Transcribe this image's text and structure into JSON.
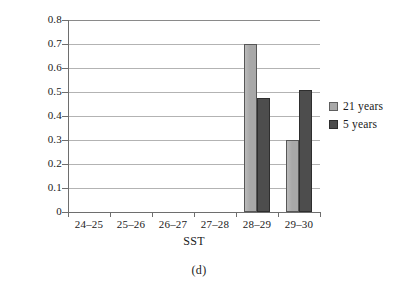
{
  "chart_data": {
    "type": "bar",
    "title": "",
    "subtitle": "",
    "xlabel": "SST",
    "ylabel": "",
    "categories": [
      "24–25",
      "25–26",
      "26–27",
      "27–28",
      "28–29",
      "29–30"
    ],
    "series": [
      {
        "name": "21 years",
        "values": [
          0,
          0,
          0,
          0,
          0.7,
          0.3
        ],
        "color": "#a8a8a8"
      },
      {
        "name": "5 years",
        "values": [
          0,
          0,
          0,
          0,
          0.475,
          0.51
        ],
        "color": "#4d4d4d"
      }
    ],
    "ylim": [
      0,
      0.8
    ],
    "ytick_labels": [
      "0.8",
      "0.7",
      "0.6",
      "0.5",
      "0.4",
      "0.3",
      "0.2",
      "0.1",
      "0"
    ],
    "ytick_values": [
      0.8,
      0.7,
      0.6,
      0.5,
      0.4,
      0.3,
      0.2,
      0.1,
      0
    ],
    "grid": true,
    "grid_axis": "y",
    "legend_position": "right"
  },
  "caption": "(d)",
  "axis": {
    "x_title": "SST"
  },
  "legend": {
    "items": [
      {
        "label": "21 years"
      },
      {
        "label": "5 years"
      }
    ]
  }
}
